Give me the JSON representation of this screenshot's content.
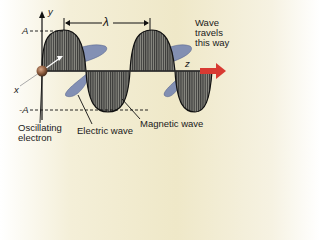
{
  "diagram": {
    "labels": {
      "y_axis": "y",
      "x_axis": "x",
      "z_axis": "z",
      "amplitude_pos": "A",
      "amplitude_neg": "-A",
      "wavelength": "λ",
      "direction_line1": "Wave",
      "direction_line2": "travels",
      "direction_line3": "this way",
      "electron_line1": "Oscillating",
      "electron_line2": "electron",
      "electric_wave": "Electric wave",
      "magnetic_wave": "Magnetic wave"
    },
    "colors": {
      "electric_wave": "#6f7fae",
      "magnetic_wave_hatch": "#333333",
      "direction_arrow": "#d83a32",
      "electron": "#8a5a3c",
      "background": "#efe8c8"
    }
  }
}
